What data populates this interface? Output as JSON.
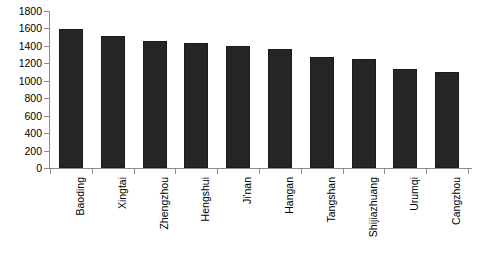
{
  "chart_data": {
    "type": "bar",
    "title": "",
    "subtitle": "",
    "xlabel": "",
    "ylabel": "",
    "categories": [
      "Baoding",
      "Xingtai",
      "Zhengzhou",
      "Hengshui",
      "Ji'nan",
      "Hangan",
      "Tangshan",
      "Shijiazhuang",
      "Urumqi",
      "Cangzhou"
    ],
    "values": [
      1590,
      1510,
      1460,
      1430,
      1395,
      1360,
      1270,
      1250,
      1130,
      1105
    ],
    "ylim": [
      0,
      1800
    ],
    "ytick_values": [
      0,
      200,
      400,
      600,
      800,
      1000,
      1200,
      1400,
      1600,
      1800
    ],
    "ytick_labels": [
      "0",
      "200",
      "400",
      "600",
      "800",
      "1000",
      "1200",
      "1400",
      "1600",
      "1800"
    ],
    "grid": false,
    "legend": null,
    "legend_position": "none",
    "bar_color": "#262626",
    "axis_color": "#8d8d8d",
    "text_color": "#000000",
    "background_color": "#ffffff",
    "annotations": []
  }
}
